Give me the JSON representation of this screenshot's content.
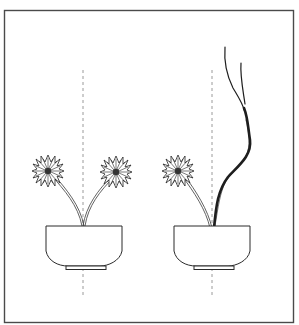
{
  "figure": {
    "colors": {
      "background": "#ffffff",
      "frame": "#4a4a4a",
      "line": "#222222",
      "guide": "#9a9a9a"
    },
    "panels": [
      {
        "name": "left-arrangement",
        "elements": [
          "bowl",
          "flower",
          "flower",
          "vertical-guide"
        ]
      },
      {
        "name": "right-arrangement",
        "elements": [
          "bowl",
          "flower",
          "branch",
          "vertical-guide"
        ]
      }
    ]
  }
}
